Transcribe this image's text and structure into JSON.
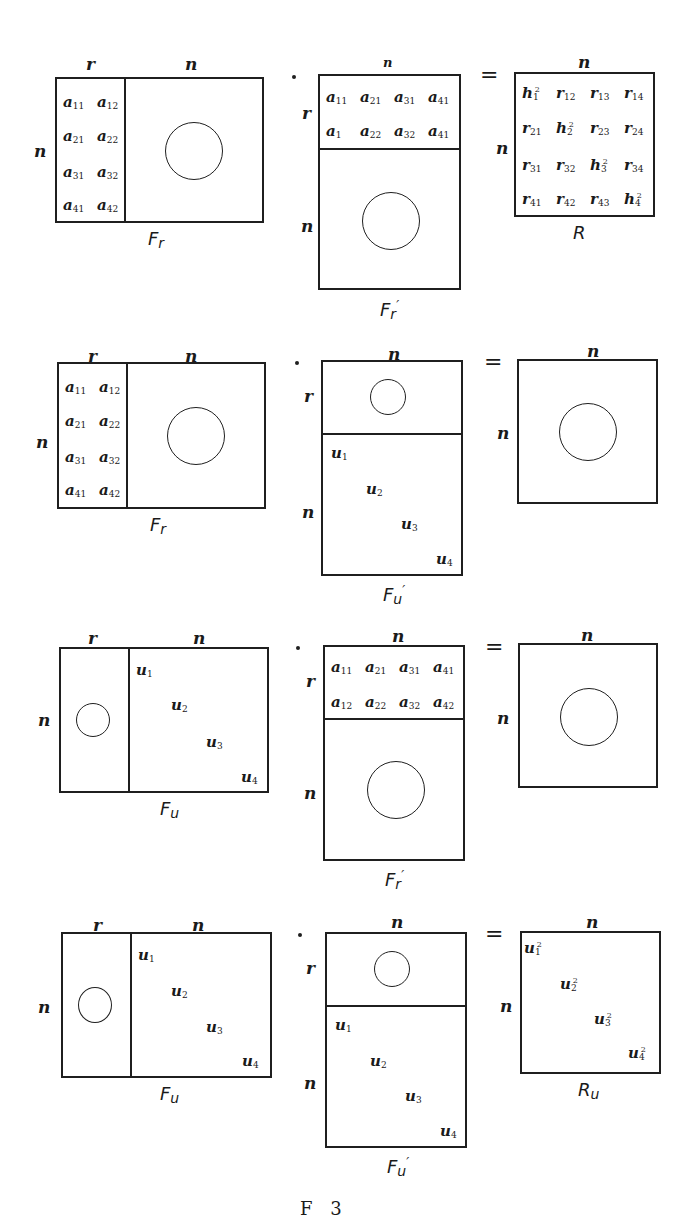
{
  "figure": {
    "bottom_caption_partial": "F     3",
    "rows": [
      {
        "left": {
          "caption": "F",
          "caption_sub": "r",
          "top_labels": [
            "r",
            "n"
          ],
          "side_label": "n",
          "elements": [
            [
              "a",
              "11"
            ],
            [
              "a",
              "12"
            ],
            [
              "a",
              "21"
            ],
            [
              "a",
              "22"
            ],
            [
              "a",
              "31"
            ],
            [
              "a",
              "32"
            ],
            [
              "a",
              "41"
            ],
            [
              "a",
              "42"
            ]
          ]
        },
        "operator": "·",
        "middle": {
          "caption": "F",
          "caption_sub": "r",
          "caption_prime": "′",
          "top_label": "n",
          "side_labels": [
            "r",
            "n"
          ],
          "elements": [
            [
              "a",
              "11"
            ],
            [
              "a",
              "21"
            ],
            [
              "a",
              "31"
            ],
            [
              "a",
              "41"
            ],
            [
              "a",
              "1"
            ],
            [
              "a",
              "22"
            ],
            [
              "a",
              "32"
            ],
            [
              "a",
              "41"
            ]
          ]
        },
        "equals": "=",
        "right": {
          "caption": "R",
          "top_label": "n",
          "side_label": "n",
          "elements": [
            [
              "h",
              "1",
              "2"
            ],
            [
              "r",
              "12",
              ""
            ],
            [
              "r",
              "13",
              ""
            ],
            [
              "r",
              "14",
              ""
            ],
            [
              "r",
              "21",
              ""
            ],
            [
              "h",
              "2",
              "2"
            ],
            [
              "r",
              "23",
              ""
            ],
            [
              "r",
              "24",
              ""
            ],
            [
              "r",
              "31",
              ""
            ],
            [
              "r",
              "32",
              ""
            ],
            [
              "h",
              "3",
              "2"
            ],
            [
              "r",
              "34",
              ""
            ],
            [
              "r",
              "41",
              ""
            ],
            [
              "r",
              "42",
              ""
            ],
            [
              "r",
              "43",
              ""
            ],
            [
              "h",
              "4",
              "2"
            ]
          ]
        }
      },
      {
        "left": {
          "caption": "F",
          "caption_sub": "r",
          "top_labels": [
            "r",
            "n"
          ],
          "side_label": "n",
          "elements": [
            [
              "a",
              "11"
            ],
            [
              "a",
              "12"
            ],
            [
              "a",
              "21"
            ],
            [
              "a",
              "22"
            ],
            [
              "a",
              "31"
            ],
            [
              "a",
              "32"
            ],
            [
              "a",
              "41"
            ],
            [
              "a",
              "42"
            ]
          ]
        },
        "operator": "·",
        "middle": {
          "caption": "F",
          "caption_sub": "u",
          "caption_prime": "′",
          "top_label": "n",
          "side_labels": [
            "r",
            "n"
          ],
          "elements": [
            [
              "u",
              "1"
            ],
            [
              "u",
              "2"
            ],
            [
              "u",
              "3"
            ],
            [
              "u",
              "4"
            ]
          ]
        },
        "equals": "=",
        "right": {
          "caption": "",
          "top_label": "n",
          "side_label": "n"
        }
      },
      {
        "left": {
          "caption": "F",
          "caption_sub": "u",
          "top_labels": [
            "r",
            "n"
          ],
          "side_label": "n",
          "elements": [
            [
              "u",
              "1"
            ],
            [
              "u",
              "2"
            ],
            [
              "u",
              "3"
            ],
            [
              "u",
              "4"
            ]
          ]
        },
        "operator": "·",
        "middle": {
          "caption": "F",
          "caption_sub": "r",
          "caption_prime": "′",
          "top_label": "n",
          "side_labels": [
            "r",
            "n"
          ],
          "elements": [
            [
              "a",
              "11"
            ],
            [
              "a",
              "21"
            ],
            [
              "a",
              "31"
            ],
            [
              "a",
              "41"
            ],
            [
              "a",
              "12"
            ],
            [
              "a",
              "22"
            ],
            [
              "a",
              "32"
            ],
            [
              "a",
              "42"
            ]
          ]
        },
        "equals": "=",
        "right": {
          "caption": "",
          "top_label": "n",
          "side_label": "n"
        }
      },
      {
        "left": {
          "caption": "F",
          "caption_sub": "u",
          "top_labels": [
            "r",
            "n"
          ],
          "side_label": "n",
          "elements": [
            [
              "u",
              "1"
            ],
            [
              "u",
              "2"
            ],
            [
              "u",
              "3"
            ],
            [
              "u",
              "4"
            ]
          ]
        },
        "operator": "·",
        "middle": {
          "caption": "F",
          "caption_sub": "u",
          "caption_prime": "′",
          "top_label": "n",
          "side_labels": [
            "r",
            "n"
          ],
          "elements": [
            [
              "u",
              "1"
            ],
            [
              "u",
              "2"
            ],
            [
              "u",
              "3"
            ],
            [
              "u",
              "4"
            ]
          ]
        },
        "equals": "=",
        "right": {
          "caption": "R",
          "caption_sub": "u",
          "top_label": "n",
          "side_label": "n",
          "elements": [
            [
              "u",
              "1",
              "2"
            ],
            [
              "u",
              "2",
              "2"
            ],
            [
              "u",
              "3",
              "2"
            ],
            [
              "u",
              "4",
              "2"
            ]
          ]
        }
      }
    ]
  }
}
